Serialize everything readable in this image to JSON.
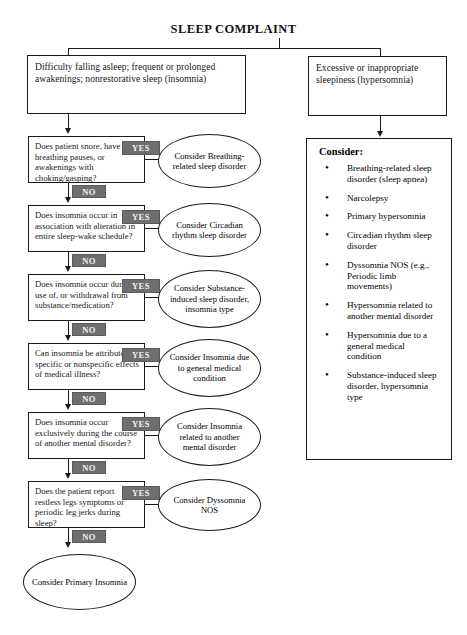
{
  "title": "SLEEP COMPLAINT",
  "branches": {
    "left": {
      "label": "Difficulty falling asleep; frequent or prolonged awakenings; nonrestorative sleep (insomnia)"
    },
    "right": {
      "label": "Excessive or inappropriate sleepiness (hypersomnia)"
    }
  },
  "tags": {
    "yes": "YES",
    "no": "NO"
  },
  "decisions": [
    {
      "question": "Does patient snore, have breathing pauses, or awakenings with choking/gasping?",
      "yes_outcome": "Consider Breathing-related sleep disorder"
    },
    {
      "question": "Does insomnia occur in association with alteration in entire sleep-wake schedule?",
      "yes_outcome": "Consider Circadian rhythm sleep disorder"
    },
    {
      "question": "Does insomnia occur during use of, or withdrawal from substance/medication?",
      "yes_outcome": "Consider Substance-induced sleep disorder, insomnia type"
    },
    {
      "question": "Can insomnia be attributed to specific or nonspecific effects of medical illness?",
      "yes_outcome": "Consider Insomnia due to general medical condition"
    },
    {
      "question": "Does insomnia occur exclusively during the course of another mental disorder?",
      "yes_outcome": "Consider Insomnia related to another mental disorder"
    },
    {
      "question": "Does the patient report restless legs symptoms or periodic leg jerks during sleep?",
      "yes_outcome": "Consider Dyssomnia NOS"
    }
  ],
  "terminal": {
    "label": "Consider Primary Insomnia"
  },
  "consider_panel": {
    "heading": "Consider:",
    "items": [
      "Breathing-related sleep disorder  (sleep apnea)",
      "Narcolepsy",
      "Primary hypersomnia",
      "Circadian rhythm sleep disorder",
      "Dyssomnia NOS (e.g., Periodic limb movements)",
      "Hypersomnia related to another mental disorder",
      "Hypersomnia due to a general medical condition",
      "Substance-induced sleep disorder, hypersomnia type"
    ]
  },
  "colors": {
    "stroke": "#1a1a1a",
    "tag_fill": "#6e6e6e",
    "tag_text": "#f2f2f2",
    "background": "#ffffff"
  }
}
